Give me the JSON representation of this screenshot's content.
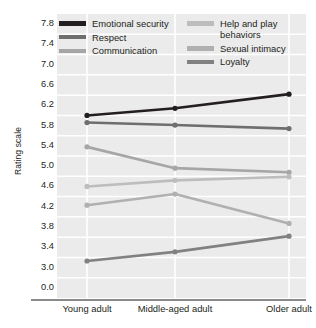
{
  "chart_data": {
    "type": "line",
    "title": "",
    "xlabel": "",
    "ylabel": "Rating scale",
    "categories": [
      "Young adult",
      "Middle-aged adult",
      "Older adult"
    ],
    "ytick_labels": [
      "7.8",
      "7.4",
      "7.0",
      "6.6",
      "6.2",
      "5.8",
      "5.4",
      "5.0",
      "4.6",
      "4.2",
      "3.8",
      "3.4",
      "3.0",
      "0.0"
    ],
    "ytick_values": [
      7.8,
      7.4,
      7.0,
      6.6,
      6.2,
      5.8,
      5.4,
      5.0,
      4.6,
      4.2,
      3.8,
      3.4,
      3.0,
      0.0
    ],
    "ylim": [
      0.0,
      7.8
    ],
    "axis_break": "Axis breaks between 3.0 and 0.0",
    "grid": "horizontal and vertical white gridlines",
    "legend_position": "top, inside plot, two columns",
    "series": [
      {
        "name": "Emotional security",
        "color": "#231f20",
        "values": [
          6.0,
          6.14,
          6.42
        ]
      },
      {
        "name": "Respect",
        "color": "#6e6e6e",
        "values": [
          5.86,
          5.81,
          5.74
        ]
      },
      {
        "name": "Communication",
        "color": "#a6a6a6",
        "values": [
          5.38,
          4.96,
          4.88
        ]
      },
      {
        "name": "Help and play behaviors",
        "color": "#bdbdbd",
        "values": [
          4.6,
          4.72,
          4.79
        ]
      },
      {
        "name": "Sexual intimacy",
        "color": "#b0b0b0",
        "values": [
          4.23,
          4.45,
          3.87
        ]
      },
      {
        "name": "Loyalty",
        "color": "#818181",
        "values": [
          3.13,
          3.31,
          3.62
        ]
      }
    ]
  },
  "legend": {
    "columns": [
      {
        "items": [
          {
            "label": "Emotional security",
            "color": "#231f20"
          },
          {
            "label": "Respect",
            "color": "#6e6e6e"
          },
          {
            "label": "Communication",
            "color": "#a6a6a6"
          }
        ]
      },
      {
        "items": [
          {
            "label": "Help and play behaviors",
            "color": "#bdbdbd"
          },
          {
            "label": "Sexual intimacy",
            "color": "#b0b0b0"
          },
          {
            "label": "Loyalty",
            "color": "#818181"
          }
        ]
      }
    ]
  },
  "colors": {
    "plot_background": "#ebebeb",
    "gridline": "#ffffff",
    "axis_rule": "#8a8a8a",
    "text": "#231f20"
  }
}
